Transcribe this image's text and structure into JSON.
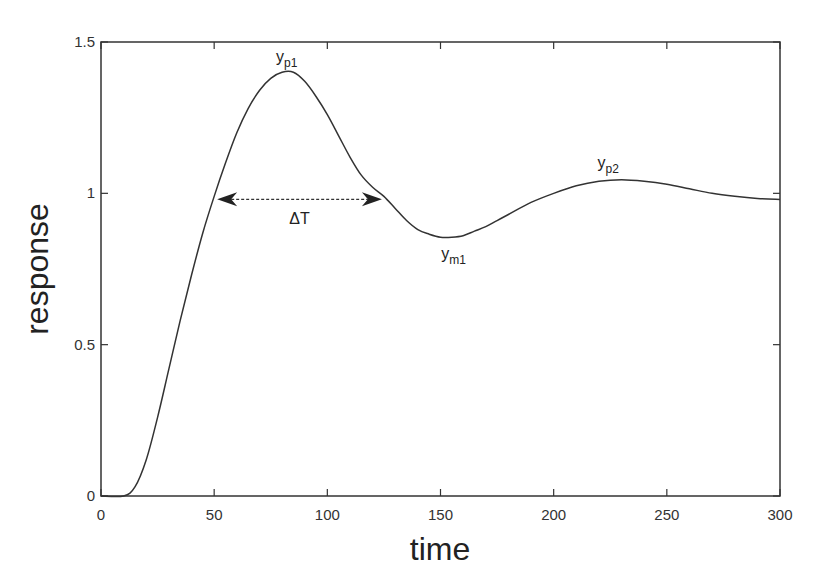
{
  "chart_data": {
    "type": "line",
    "title": "",
    "xlabel": "time",
    "ylabel": "response",
    "xlim": [
      0,
      300
    ],
    "ylim": [
      0,
      1.5
    ],
    "xticks": [
      0,
      50,
      100,
      150,
      200,
      250,
      300
    ],
    "yticks": [
      0,
      0.5,
      1,
      1.5
    ],
    "xtick_labels": [
      "0",
      "50",
      "100",
      "150",
      "200",
      "250",
      "300"
    ],
    "ytick_labels": [
      "0",
      "0.5",
      "1",
      "1.5"
    ],
    "grid": false,
    "legend": null,
    "series": [
      {
        "name": "response",
        "x": [
          0,
          10,
          15,
          20,
          25,
          30,
          35,
          40,
          45,
          50,
          55,
          60,
          65,
          70,
          75,
          80,
          85,
          90,
          95,
          100,
          105,
          110,
          115,
          120,
          125,
          130,
          135,
          140,
          145,
          150,
          155,
          160,
          165,
          170,
          175,
          180,
          190,
          200,
          210,
          220,
          230,
          240,
          250,
          260,
          270,
          280,
          290,
          300
        ],
        "y": [
          0,
          0,
          0.03,
          0.12,
          0.26,
          0.42,
          0.58,
          0.73,
          0.87,
          0.99,
          1.1,
          1.2,
          1.28,
          1.34,
          1.38,
          1.4,
          1.4,
          1.37,
          1.32,
          1.26,
          1.19,
          1.12,
          1.06,
          1.02,
          0.99,
          0.95,
          0.91,
          0.88,
          0.865,
          0.855,
          0.855,
          0.86,
          0.875,
          0.89,
          0.91,
          0.93,
          0.97,
          1.0,
          1.025,
          1.04,
          1.045,
          1.04,
          1.03,
          1.015,
          1.0,
          0.99,
          0.983,
          0.98
        ]
      }
    ],
    "annotations": [
      {
        "label": "y",
        "sub": "p1",
        "x": 80,
        "y": 1.4,
        "text": "y_p1"
      },
      {
        "label": "y",
        "sub": "m1",
        "x": 157,
        "y": 0.855,
        "text": "y_m1"
      },
      {
        "label": "y",
        "sub": "p2",
        "x": 230,
        "y": 1.045,
        "text": "y_p2"
      },
      {
        "label": "ΔT",
        "type": "double-arrow",
        "x_start": 50,
        "x_end": 125,
        "y": 0.99,
        "text": "ΔT"
      }
    ]
  },
  "labels": {
    "xlabel": "time",
    "ylabel": "response",
    "yp1_main": "y",
    "yp1_sub": "p1",
    "ym1_main": "y",
    "ym1_sub": "m1",
    "yp2_main": "y",
    "yp2_sub": "p2",
    "delta_t": "ΔT"
  }
}
